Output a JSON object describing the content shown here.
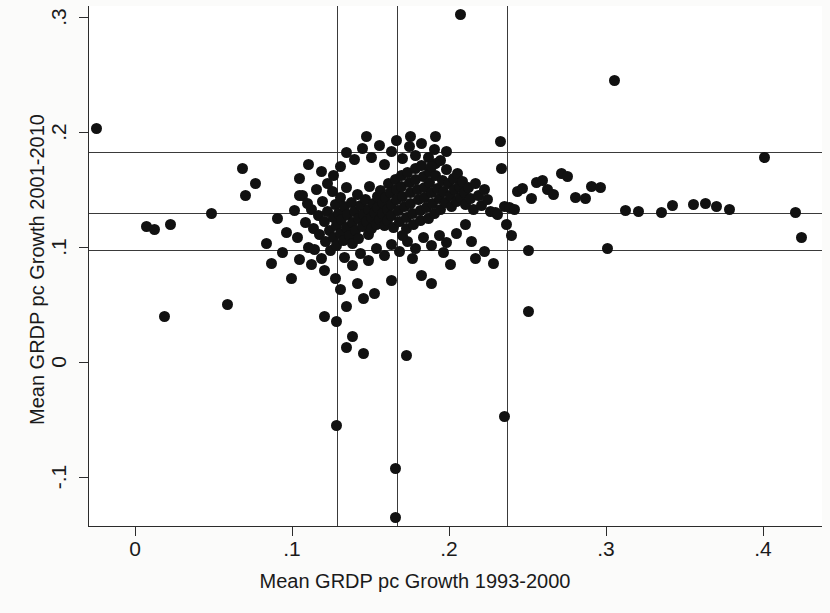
{
  "chart_data": {
    "type": "scatter",
    "title": "",
    "xlabel": "Mean GRDP pc Growth 1993-2000",
    "ylabel": "Mean GRDP pc Growth 2001-2010",
    "xlim": [
      -0.03,
      0.438
    ],
    "ylim": [
      -0.143,
      0.315
    ],
    "xticks": [
      0,
      0.1,
      0.2,
      0.3,
      0.4
    ],
    "xticklabels": [
      "0",
      ".1",
      ".2",
      ".3",
      ".4"
    ],
    "yticks": [
      -0.1,
      0,
      0.1,
      0.2,
      0.3
    ],
    "yticklabels": [
      "-.1",
      "0",
      ".1",
      ".2",
      ".3"
    ],
    "grid": false,
    "legend": null,
    "marker_color": "#111111",
    "refline_color": "#3a3a3a",
    "hlines": [
      0.183,
      0.13,
      0.097
    ],
    "vlines": [
      0.128,
      0.166,
      0.236
    ],
    "points": [
      [
        -0.025,
        0.203
      ],
      [
        0.007,
        0.118
      ],
      [
        0.012,
        0.115
      ],
      [
        0.022,
        0.12
      ],
      [
        0.018,
        0.04
      ],
      [
        0.048,
        0.129
      ],
      [
        0.058,
        0.05
      ],
      [
        0.068,
        0.168
      ],
      [
        0.07,
        0.145
      ],
      [
        0.076,
        0.155
      ],
      [
        0.083,
        0.103
      ],
      [
        0.086,
        0.086
      ],
      [
        0.09,
        0.125
      ],
      [
        0.093,
        0.095
      ],
      [
        0.096,
        0.113
      ],
      [
        0.099,
        0.073
      ],
      [
        0.101,
        0.132
      ],
      [
        0.103,
        0.108
      ],
      [
        0.104,
        0.089
      ],
      [
        0.106,
        0.145
      ],
      [
        0.108,
        0.121
      ],
      [
        0.11,
        0.1
      ],
      [
        0.112,
        0.133
      ],
      [
        0.113,
        0.116
      ],
      [
        0.114,
        0.098
      ],
      [
        0.116,
        0.127
      ],
      [
        0.117,
        0.111
      ],
      [
        0.118,
        0.09
      ],
      [
        0.119,
        0.14
      ],
      [
        0.12,
        0.122
      ],
      [
        0.121,
        0.105
      ],
      [
        0.122,
        0.131
      ],
      [
        0.123,
        0.114
      ],
      [
        0.124,
        0.097
      ],
      [
        0.125,
        0.148
      ],
      [
        0.126,
        0.126
      ],
      [
        0.126,
        0.108
      ],
      [
        0.127,
        0.137
      ],
      [
        0.128,
        0.119
      ],
      [
        0.128,
        0.101
      ],
      [
        0.129,
        0.129
      ],
      [
        0.13,
        0.112
      ],
      [
        0.13,
        0.143
      ],
      [
        0.131,
        0.124
      ],
      [
        0.132,
        0.106
      ],
      [
        0.133,
        0.135
      ],
      [
        0.134,
        0.117
      ],
      [
        0.134,
        0.152
      ],
      [
        0.135,
        0.128
      ],
      [
        0.136,
        0.11
      ],
      [
        0.137,
        0.139
      ],
      [
        0.138,
        0.121
      ],
      [
        0.138,
        0.103
      ],
      [
        0.139,
        0.131
      ],
      [
        0.14,
        0.114
      ],
      [
        0.141,
        0.146
      ],
      [
        0.142,
        0.125
      ],
      [
        0.142,
        0.107
      ],
      [
        0.143,
        0.136
      ],
      [
        0.144,
        0.118
      ],
      [
        0.145,
        0.128
      ],
      [
        0.146,
        0.141
      ],
      [
        0.147,
        0.122
      ],
      [
        0.148,
        0.111
      ],
      [
        0.148,
        0.133
      ],
      [
        0.149,
        0.153
      ],
      [
        0.15,
        0.126
      ],
      [
        0.15,
        0.116
      ],
      [
        0.151,
        0.138
      ],
      [
        0.152,
        0.13
      ],
      [
        0.153,
        0.12
      ],
      [
        0.154,
        0.144
      ],
      [
        0.154,
        0.134
      ],
      [
        0.155,
        0.124
      ],
      [
        0.156,
        0.149
      ],
      [
        0.157,
        0.139
      ],
      [
        0.157,
        0.129
      ],
      [
        0.158,
        0.119
      ],
      [
        0.159,
        0.143
      ],
      [
        0.16,
        0.133
      ],
      [
        0.16,
        0.123
      ],
      [
        0.161,
        0.155
      ],
      [
        0.162,
        0.147
      ],
      [
        0.163,
        0.137
      ],
      [
        0.163,
        0.127
      ],
      [
        0.164,
        0.117
      ],
      [
        0.165,
        0.159
      ],
      [
        0.166,
        0.15
      ],
      [
        0.166,
        0.141
      ],
      [
        0.167,
        0.132
      ],
      [
        0.168,
        0.122
      ],
      [
        0.169,
        0.162
      ],
      [
        0.169,
        0.153
      ],
      [
        0.17,
        0.144
      ],
      [
        0.171,
        0.135
      ],
      [
        0.172,
        0.126
      ],
      [
        0.172,
        0.116
      ],
      [
        0.173,
        0.165
      ],
      [
        0.174,
        0.156
      ],
      [
        0.175,
        0.147
      ],
      [
        0.175,
        0.138
      ],
      [
        0.176,
        0.129
      ],
      [
        0.177,
        0.12
      ],
      [
        0.178,
        0.168
      ],
      [
        0.178,
        0.159
      ],
      [
        0.179,
        0.15
      ],
      [
        0.18,
        0.141
      ],
      [
        0.181,
        0.132
      ],
      [
        0.181,
        0.123
      ],
      [
        0.182,
        0.171
      ],
      [
        0.183,
        0.161
      ],
      [
        0.184,
        0.152
      ],
      [
        0.184,
        0.143
      ],
      [
        0.185,
        0.134
      ],
      [
        0.186,
        0.125
      ],
      [
        0.187,
        0.166
      ],
      [
        0.187,
        0.156
      ],
      [
        0.188,
        0.147
      ],
      [
        0.189,
        0.138
      ],
      [
        0.19,
        0.129
      ],
      [
        0.191,
        0.173
      ],
      [
        0.191,
        0.162
      ],
      [
        0.192,
        0.151
      ],
      [
        0.193,
        0.142
      ],
      [
        0.194,
        0.133
      ],
      [
        0.195,
        0.158
      ],
      [
        0.196,
        0.148
      ],
      [
        0.197,
        0.139
      ],
      [
        0.198,
        0.167
      ],
      [
        0.199,
        0.155
      ],
      [
        0.2,
        0.145
      ],
      [
        0.201,
        0.135
      ],
      [
        0.202,
        0.16
      ],
      [
        0.203,
        0.15
      ],
      [
        0.204,
        0.14
      ],
      [
        0.205,
        0.164
      ],
      [
        0.206,
        0.153
      ],
      [
        0.207,
        0.143
      ],
      [
        0.208,
        0.157
      ],
      [
        0.209,
        0.147
      ],
      [
        0.21,
        0.137
      ],
      [
        0.212,
        0.152
      ],
      [
        0.213,
        0.142
      ],
      [
        0.215,
        0.133
      ],
      [
        0.216,
        0.155
      ],
      [
        0.218,
        0.145
      ],
      [
        0.22,
        0.136
      ],
      [
        0.222,
        0.15
      ],
      [
        0.224,
        0.141
      ],
      [
        0.226,
        0.131
      ],
      [
        0.13,
        0.17
      ],
      [
        0.134,
        0.182
      ],
      [
        0.139,
        0.176
      ],
      [
        0.144,
        0.186
      ],
      [
        0.15,
        0.178
      ],
      [
        0.155,
        0.188
      ],
      [
        0.158,
        0.172
      ],
      [
        0.163,
        0.183
      ],
      [
        0.166,
        0.193
      ],
      [
        0.17,
        0.177
      ],
      [
        0.174,
        0.187
      ],
      [
        0.178,
        0.18
      ],
      [
        0.182,
        0.19
      ],
      [
        0.186,
        0.178
      ],
      [
        0.19,
        0.185
      ],
      [
        0.194,
        0.175
      ],
      [
        0.198,
        0.183
      ],
      [
        0.147,
        0.196
      ],
      [
        0.175,
        0.196
      ],
      [
        0.188,
        0.17
      ],
      [
        0.104,
        0.16
      ],
      [
        0.11,
        0.172
      ],
      [
        0.118,
        0.166
      ],
      [
        0.122,
        0.155
      ],
      [
        0.126,
        0.162
      ],
      [
        0.112,
        0.085
      ],
      [
        0.12,
        0.08
      ],
      [
        0.127,
        0.073
      ],
      [
        0.133,
        0.091
      ],
      [
        0.138,
        0.084
      ],
      [
        0.143,
        0.094
      ],
      [
        0.148,
        0.088
      ],
      [
        0.153,
        0.099
      ],
      [
        0.158,
        0.093
      ],
      [
        0.163,
        0.102
      ],
      [
        0.168,
        0.096
      ],
      [
        0.173,
        0.105
      ],
      [
        0.178,
        0.099
      ],
      [
        0.183,
        0.108
      ],
      [
        0.188,
        0.101
      ],
      [
        0.193,
        0.11
      ],
      [
        0.198,
        0.104
      ],
      [
        0.204,
        0.112
      ],
      [
        0.13,
        0.063
      ],
      [
        0.141,
        0.068
      ],
      [
        0.152,
        0.06
      ],
      [
        0.163,
        0.071
      ],
      [
        0.17,
        0.11
      ],
      [
        0.176,
        0.09
      ],
      [
        0.12,
        0.04
      ],
      [
        0.134,
        0.048
      ],
      [
        0.145,
        0.055
      ],
      [
        0.104,
        0.145
      ],
      [
        0.109,
        0.138
      ],
      [
        0.115,
        0.15
      ],
      [
        0.128,
        0.035
      ],
      [
        0.138,
        0.022
      ],
      [
        0.207,
        0.302
      ],
      [
        0.191,
        0.196
      ],
      [
        0.232,
        0.192
      ],
      [
        0.233,
        0.168
      ],
      [
        0.235,
        0.135
      ],
      [
        0.238,
        0.134
      ],
      [
        0.241,
        0.133
      ],
      [
        0.229,
        0.13
      ],
      [
        0.23,
        0.128
      ],
      [
        0.236,
        0.12
      ],
      [
        0.239,
        0.11
      ],
      [
        0.243,
        0.148
      ],
      [
        0.246,
        0.151
      ],
      [
        0.25,
        0.097
      ],
      [
        0.252,
        0.142
      ],
      [
        0.255,
        0.156
      ],
      [
        0.259,
        0.158
      ],
      [
        0.262,
        0.15
      ],
      [
        0.266,
        0.146
      ],
      [
        0.271,
        0.164
      ],
      [
        0.275,
        0.161
      ],
      [
        0.28,
        0.143
      ],
      [
        0.286,
        0.142
      ],
      [
        0.29,
        0.153
      ],
      [
        0.296,
        0.152
      ],
      [
        0.3,
        0.099
      ],
      [
        0.305,
        0.245
      ],
      [
        0.312,
        0.132
      ],
      [
        0.32,
        0.131
      ],
      [
        0.335,
        0.13
      ],
      [
        0.342,
        0.136
      ],
      [
        0.355,
        0.137
      ],
      [
        0.363,
        0.138
      ],
      [
        0.37,
        0.135
      ],
      [
        0.378,
        0.133
      ],
      [
        0.4,
        0.178
      ],
      [
        0.42,
        0.13
      ],
      [
        0.424,
        0.108
      ],
      [
        0.216,
        0.09
      ],
      [
        0.222,
        0.096
      ],
      [
        0.228,
        0.086
      ],
      [
        0.21,
        0.12
      ],
      [
        0.214,
        0.105
      ],
      [
        0.196,
        0.095
      ],
      [
        0.2,
        0.085
      ],
      [
        0.182,
        0.075
      ],
      [
        0.188,
        0.068
      ],
      [
        0.25,
        0.044
      ],
      [
        0.128,
        -0.055
      ],
      [
        0.165,
        -0.093
      ],
      [
        0.165,
        -0.135
      ],
      [
        0.235,
        -0.047
      ],
      [
        0.145,
        0.007
      ],
      [
        0.134,
        0.013
      ],
      [
        0.172,
        0.006
      ]
    ]
  }
}
